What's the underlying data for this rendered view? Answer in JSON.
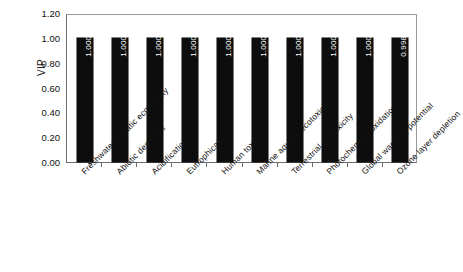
{
  "chart_data": {
    "type": "bar",
    "title": "",
    "xlabel": "",
    "ylabel": "VIP",
    "ylim": [
      0.0,
      1.2
    ],
    "ytick_labels": [
      "0.00",
      "0.20",
      "0.40",
      "0.60",
      "0.80",
      "1.00",
      "1.20"
    ],
    "ytick_values": [
      0.0,
      0.2,
      0.4,
      0.6,
      0.8,
      1.0,
      1.2
    ],
    "grid": false,
    "legend": "none",
    "bar_color": "#0d0d0d",
    "data_label_color": "#ffffff",
    "categories": [
      "Freshwater aquatic ecotoxicity",
      "Abiotic depletion",
      "Acidification",
      "Eutrophication",
      "Human toxicity",
      "Marine aquatic ecotoxicity",
      "Terrestrial ecotoxicity",
      "Photochemical oxidation",
      "Global warming potential",
      "Ozone layer depletion"
    ],
    "values": [
      1.0003,
      1.0002,
      1.0002,
      1.0002,
      1.0002,
      1.0002,
      1.0002,
      1.0002,
      1.0001,
      0.9981
    ],
    "data_labels": [
      "1.0003",
      "1.0002",
      "1.0002",
      "1.0002",
      "1.0002",
      "1.0002",
      "1.0002",
      "1.0002",
      "1.0001",
      "0.9981"
    ]
  }
}
